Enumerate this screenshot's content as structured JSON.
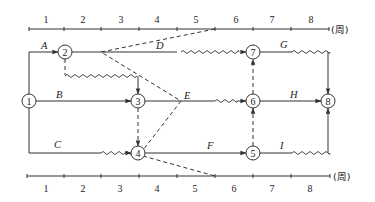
{
  "diagram": {
    "time_axis": {
      "unit_label": "(周)",
      "ticks": [
        "1",
        "2",
        "3",
        "4",
        "5",
        "6",
        "7",
        "8"
      ]
    },
    "nodes": [
      {
        "id": "1",
        "label": "1"
      },
      {
        "id": "2",
        "label": "2"
      },
      {
        "id": "3",
        "label": "3"
      },
      {
        "id": "4",
        "label": "4"
      },
      {
        "id": "5",
        "label": "5"
      },
      {
        "id": "6",
        "label": "6"
      },
      {
        "id": "7",
        "label": "7"
      },
      {
        "id": "8",
        "label": "8"
      }
    ],
    "activities": [
      {
        "name": "A",
        "from": "1",
        "to": "2"
      },
      {
        "name": "B",
        "from": "1",
        "to": "3"
      },
      {
        "name": "C",
        "from": "1",
        "to": "4"
      },
      {
        "name": "D",
        "from": "2",
        "to": "7"
      },
      {
        "name": "E",
        "from": "3",
        "to": "6"
      },
      {
        "name": "F",
        "from": "4",
        "to": "5"
      },
      {
        "name": "G",
        "from": "7",
        "to": "8"
      },
      {
        "name": "H",
        "from": "6",
        "to": "8"
      },
      {
        "name": "I",
        "from": "5",
        "to": "8"
      }
    ],
    "dummy_activities": [
      {
        "from": "2",
        "to": "3"
      },
      {
        "from": "3",
        "to": "4"
      },
      {
        "from": "5",
        "to": "6"
      },
      {
        "from": "6",
        "to": "7"
      }
    ],
    "check_line": {
      "style": "dashed",
      "points_desc": "Top axis week 5 end → D at week 2 → E at week 4 → node 4 → bottom axis week 5 end"
    }
  }
}
